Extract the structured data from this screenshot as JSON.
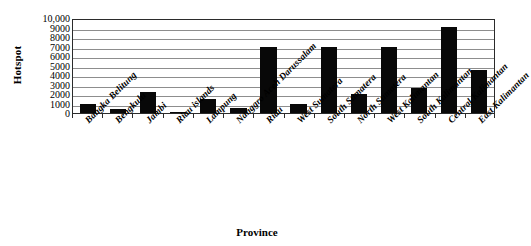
{
  "chart_data": {
    "type": "bar",
    "title": "",
    "xlabel": "Province",
    "ylabel": "Hotspot",
    "ylim": [
      0,
      10000
    ],
    "ytick_step": 1000,
    "grid": true,
    "legend": "none",
    "bar_color": "#080808",
    "categories": [
      "Bangka Belitung",
      "Bengkulu",
      "Jambi",
      "Riau islands",
      "Lampung",
      "Nanggro Aceh Darussalam",
      "Riau",
      "West Sumatera",
      "South Sumatera",
      "North Sumatera",
      "West Kalimantan",
      "South Kalimantan",
      "Central Kalimantan",
      "East Kalimantan"
    ],
    "values": [
      1000,
      400,
      2200,
      150,
      1500,
      500,
      7000,
      1000,
      7000,
      2000,
      7000,
      2600,
      9100,
      4500
    ],
    "ytick_labels": [
      "0",
      "1000",
      "2000",
      "3000",
      "4000",
      "5000",
      "6000",
      "7000",
      "8000",
      "9000",
      "10,000"
    ],
    "ytick_values": [
      0,
      1000,
      2000,
      3000,
      4000,
      5000,
      6000,
      7000,
      8000,
      9000,
      10000
    ]
  }
}
